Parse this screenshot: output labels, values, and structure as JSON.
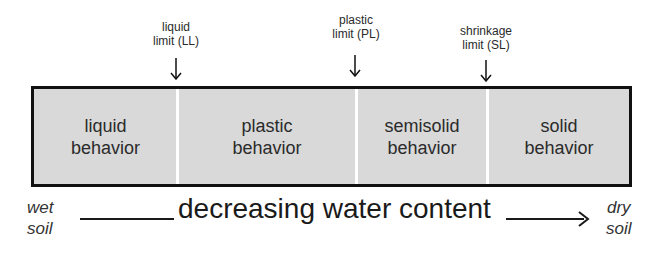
{
  "limits": [
    {
      "line1": "liquid",
      "line2": "limit (LL)"
    },
    {
      "line1": "plastic",
      "line2": "limit (PL)"
    },
    {
      "line1": "shrinkage",
      "line2": "limit (SL)"
    }
  ],
  "zones": [
    {
      "line1": "liquid",
      "line2": "behavior"
    },
    {
      "line1": "plastic",
      "line2": "behavior"
    },
    {
      "line1": "semisolid",
      "line2": "behavior"
    },
    {
      "line1": "solid",
      "line2": "behavior"
    }
  ],
  "axis": {
    "left_line1": "wet",
    "left_line2": "soil",
    "label": "decreasing water content",
    "right_line1": "dry",
    "right_line2": "soil"
  },
  "colors": {
    "bar_fill": "#d9d9d9",
    "border": "#111111",
    "divider": "#ffffff"
  }
}
